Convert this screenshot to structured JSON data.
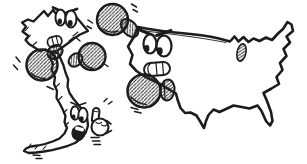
{
  "illustration": {
    "title": "Cartoon of the map of Vietnam boxing the map of the United States",
    "style": "black ink comic drawing with diagonal hatching",
    "background_color": "#ffffff",
    "ink_color": "#1c1c1c",
    "hatch_color": "#2b2b2b",
    "fill_color": "#ffffff",
    "figures": {
      "vietnam": {
        "name": "Vietnam map as boxer",
        "north_face_expression": "angry, gritted teeth",
        "south_face_expression": "shouting, open mouth",
        "glove_count": 2
      },
      "usa": {
        "name": "United States map as boxer",
        "face_expression": "angry, gritted teeth",
        "glove_count": 2
      },
      "extra_hand": {
        "name": "small cartoon hand",
        "gesture": "index finger raised"
      }
    },
    "props": {
      "boxing_gloves_total": 4,
      "motion_marks": "speed dashes around gloves, hand and tail"
    }
  }
}
